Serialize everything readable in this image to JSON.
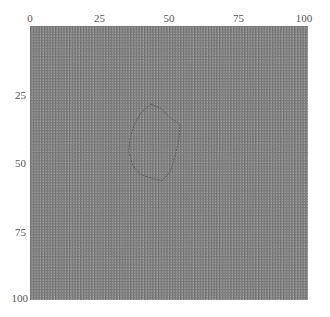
{
  "chart_data": {
    "type": "heatmap",
    "title": "",
    "xlabel": "",
    "ylabel": "",
    "xlim": [
      0,
      100
    ],
    "ylim": [
      100,
      0
    ],
    "x_ticks": [
      0,
      25,
      50,
      75,
      100
    ],
    "y_ticks": [
      25,
      50,
      75,
      100
    ],
    "x_tick_labels": [
      "0",
      "25",
      "50",
      "75",
      "100"
    ],
    "y_tick_labels": [
      "25",
      "50",
      "75",
      "100"
    ],
    "grid": true,
    "grid_resolution": 100,
    "background_pattern": "fine gray checker mesh",
    "contour": {
      "label": "segmentation outline",
      "closed": true,
      "points": [
        [
          43.5,
          28.5
        ],
        [
          47,
          30
        ],
        [
          50.5,
          33.5
        ],
        [
          54,
          36
        ],
        [
          53.5,
          42
        ],
        [
          52,
          48
        ],
        [
          50.5,
          53
        ],
        [
          47.5,
          56.5
        ],
        [
          43.5,
          55.5
        ],
        [
          39.5,
          54
        ],
        [
          37,
          51
        ],
        [
          35.5,
          46
        ],
        [
          36,
          41
        ],
        [
          37.5,
          36
        ],
        [
          40,
          31.5
        ]
      ],
      "color": "#5a5a5a",
      "style": "dashed"
    },
    "colors": {
      "mesh_dark": "#6e6e6e",
      "mesh_light": "#a9a9a9",
      "tick_label": "#555555"
    }
  },
  "axes": {
    "x_labels": [
      "0",
      "25",
      "50",
      "75",
      "100"
    ],
    "y_labels": [
      "25",
      "50",
      "75",
      "100"
    ]
  }
}
